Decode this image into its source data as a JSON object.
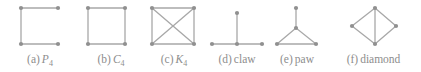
{
  "figure": {
    "style": {
      "edge_color": "#a8a8a8",
      "vertex_color": "#909090",
      "caption_color": "#8d8d8d",
      "background": "#ffffff",
      "edge_width": 1.3,
      "vertex_radius": 2.1
    },
    "graphs": [
      {
        "id": "p4",
        "caption_index": "(a)",
        "caption_name": "P",
        "caption_subscript": "4",
        "caption_style": "math",
        "cell_left": 0,
        "cell_width": 80,
        "vertices": [
          {
            "name": "top-left",
            "x": 21,
            "y": 8
          },
          {
            "name": "top-right",
            "x": 58,
            "y": 8
          },
          {
            "name": "bottom-left",
            "x": 21,
            "y": 44
          },
          {
            "name": "bottom-right",
            "x": 58,
            "y": 44
          }
        ],
        "edges": [
          {
            "from": 0,
            "to": 1
          },
          {
            "from": 0,
            "to": 2
          },
          {
            "from": 2,
            "to": 3
          }
        ]
      },
      {
        "id": "c4",
        "caption_index": "(b)",
        "caption_name": "C",
        "caption_subscript": "4",
        "caption_style": "math",
        "cell_left": 80,
        "cell_width": 62,
        "vertices": [
          {
            "name": "top-left",
            "x": 8,
            "y": 8
          },
          {
            "name": "top-right",
            "x": 45,
            "y": 8
          },
          {
            "name": "bottom-left",
            "x": 8,
            "y": 44
          },
          {
            "name": "bottom-right",
            "x": 45,
            "y": 44
          }
        ],
        "edges": [
          {
            "from": 0,
            "to": 1
          },
          {
            "from": 0,
            "to": 2
          },
          {
            "from": 1,
            "to": 3
          },
          {
            "from": 2,
            "to": 3
          }
        ]
      },
      {
        "id": "k4",
        "caption_index": "(c)",
        "caption_name": "K",
        "caption_subscript": "4",
        "caption_style": "math",
        "cell_left": 142,
        "cell_width": 64,
        "vertices": [
          {
            "name": "top-left",
            "x": 10,
            "y": 8
          },
          {
            "name": "top-right",
            "x": 52,
            "y": 8
          },
          {
            "name": "bottom-left",
            "x": 10,
            "y": 44
          },
          {
            "name": "bottom-right",
            "x": 52,
            "y": 44
          }
        ],
        "edges": [
          {
            "from": 0,
            "to": 1
          },
          {
            "from": 0,
            "to": 2
          },
          {
            "from": 1,
            "to": 3
          },
          {
            "from": 2,
            "to": 3
          },
          {
            "from": 0,
            "to": 3
          },
          {
            "from": 1,
            "to": 2
          }
        ]
      },
      {
        "id": "claw",
        "caption_index": "(d)",
        "caption_name": "claw",
        "caption_subscript": "",
        "caption_style": "text",
        "cell_left": 206,
        "cell_width": 62,
        "vertices": [
          {
            "name": "center",
            "x": 31,
            "y": 44
          },
          {
            "name": "leaf-top",
            "x": 31,
            "y": 13
          },
          {
            "name": "leaf-left",
            "x": 6,
            "y": 44
          },
          {
            "name": "leaf-right",
            "x": 56,
            "y": 44
          }
        ],
        "edges": [
          {
            "from": 0,
            "to": 1
          },
          {
            "from": 0,
            "to": 2
          },
          {
            "from": 0,
            "to": 3
          }
        ]
      },
      {
        "id": "paw",
        "caption_index": "(e)",
        "caption_name": "paw",
        "caption_subscript": "",
        "caption_style": "text",
        "cell_left": 268,
        "cell_width": 58,
        "vertices": [
          {
            "name": "apex",
            "x": 28,
            "y": 28
          },
          {
            "name": "pendant-top",
            "x": 28,
            "y": 8
          },
          {
            "name": "base-left",
            "x": 9,
            "y": 44
          },
          {
            "name": "base-right",
            "x": 48,
            "y": 44
          }
        ],
        "edges": [
          {
            "from": 0,
            "to": 1
          },
          {
            "from": 0,
            "to": 2
          },
          {
            "from": 0,
            "to": 3
          },
          {
            "from": 2,
            "to": 3
          }
        ]
      },
      {
        "id": "diamond",
        "caption_index": "(f)",
        "caption_name": "diamond",
        "caption_subscript": "",
        "caption_style": "text",
        "cell_left": 326,
        "cell_width": 95,
        "vertices": [
          {
            "name": "top",
            "x": 49,
            "y": 8
          },
          {
            "name": "bottom",
            "x": 49,
            "y": 44
          },
          {
            "name": "left",
            "x": 26,
            "y": 26
          },
          {
            "name": "right",
            "x": 70,
            "y": 26
          }
        ],
        "edges": [
          {
            "from": 0,
            "to": 2
          },
          {
            "from": 0,
            "to": 3
          },
          {
            "from": 1,
            "to": 2
          },
          {
            "from": 1,
            "to": 3
          },
          {
            "from": 0,
            "to": 1
          }
        ]
      }
    ]
  }
}
